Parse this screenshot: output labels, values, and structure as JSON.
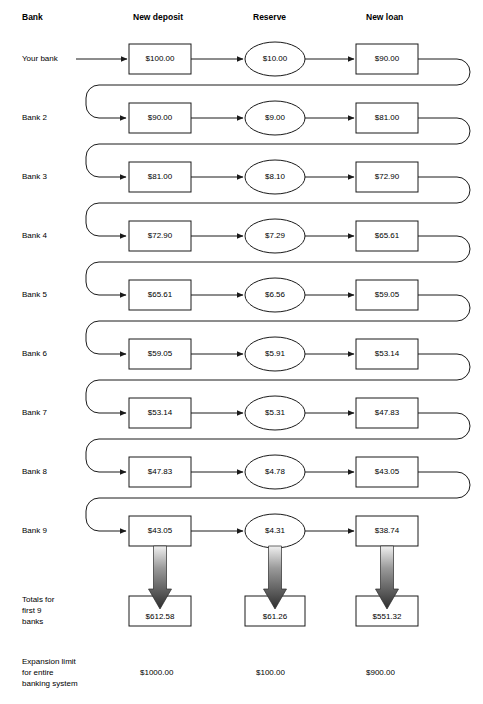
{
  "headers": {
    "bank": "Bank",
    "new_deposit": "New deposit",
    "reserve": "Reserve",
    "new_loan": "New loan"
  },
  "rows": [
    {
      "label": "Your bank",
      "deposit": "$100.00",
      "reserve": "$10.00",
      "loan": "$90.00"
    },
    {
      "label": "Bank 2",
      "deposit": "$90.00",
      "reserve": "$9.00",
      "loan": "$81.00"
    },
    {
      "label": "Bank 3",
      "deposit": "$81.00",
      "reserve": "$8.10",
      "loan": "$72.90"
    },
    {
      "label": "Bank 4",
      "deposit": "$72.90",
      "reserve": "$7.29",
      "loan": "$65.61"
    },
    {
      "label": "Bank 5",
      "deposit": "$65.61",
      "reserve": "$6.56",
      "loan": "$59.05"
    },
    {
      "label": "Bank 6",
      "deposit": "$59.05",
      "reserve": "$5.91",
      "loan": "$53.14"
    },
    {
      "label": "Bank 7",
      "deposit": "$53.14",
      "reserve": "$5.31",
      "loan": "$47.83"
    },
    {
      "label": "Bank 8",
      "deposit": "$47.83",
      "reserve": "$4.78",
      "loan": "$43.05"
    },
    {
      "label": "Bank 9",
      "deposit": "$43.05",
      "reserve": "$4.31",
      "loan": "$38.74"
    }
  ],
  "totals": {
    "label_line1": "Totals for",
    "label_line2": "first 9",
    "label_line3": "banks",
    "deposit": "$612.58",
    "reserve": "$61.26",
    "loan": "$551.32"
  },
  "expansion": {
    "label_line1": "Expansion limit",
    "label_line2": "for entire",
    "label_line3": "banking system",
    "deposit": "$1000.00",
    "reserve": "$100.00",
    "loan": "$900.00"
  },
  "chart_data": {
    "type": "diagram",
    "columns": [
      "Bank",
      "New deposit",
      "Reserve",
      "New loan"
    ],
    "reserve_ratio": 0.1,
    "categories": [
      "Your bank",
      "Bank 2",
      "Bank 3",
      "Bank 4",
      "Bank 5",
      "Bank 6",
      "Bank 7",
      "Bank 8",
      "Bank 9"
    ],
    "series": [
      {
        "name": "New deposit",
        "values": [
          100.0,
          90.0,
          81.0,
          72.9,
          65.61,
          59.05,
          53.14,
          47.83,
          43.05
        ]
      },
      {
        "name": "Reserve",
        "values": [
          10.0,
          9.0,
          8.1,
          7.29,
          6.56,
          5.91,
          5.31,
          4.78,
          4.31
        ]
      },
      {
        "name": "New loan",
        "values": [
          90.0,
          81.0,
          72.9,
          65.61,
          59.05,
          53.14,
          47.83,
          43.05,
          38.74
        ]
      }
    ],
    "totals_first_9": {
      "new_deposit": 612.58,
      "reserve": 61.26,
      "new_loan": 551.32
    },
    "expansion_limit": {
      "new_deposit": 1000.0,
      "reserve": 100.0,
      "new_loan": 900.0
    },
    "annotations": [
      "Each bank's new loan becomes the next bank's new deposit",
      "Reserve is 10% of new deposit"
    ]
  },
  "colors": {
    "stroke": "#1a1a1a",
    "text": "#000000",
    "background": "#ffffff",
    "arrow_gradient_light": "#e8e8e8",
    "arrow_gradient_dark": "#3a3a3a"
  }
}
